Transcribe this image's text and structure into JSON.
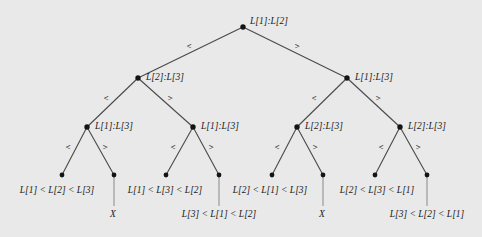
{
  "figure": {
    "type": "binary-decision-tree",
    "background_color": "#e9e9e9",
    "ink_color": "#1a1a1a",
    "width": 482,
    "height": 237
  },
  "chart_data": {
    "type": "diagram",
    "title": "",
    "nodes": [
      {
        "id": "n0",
        "label": "L[1]:L[2]",
        "kind": "internal",
        "depth": 0,
        "x": 243,
        "y": 27
      },
      {
        "id": "n1",
        "label": "L[2]:L[3]",
        "kind": "internal",
        "depth": 1,
        "x": 138,
        "y": 78
      },
      {
        "id": "n2",
        "label": "L[1]:L[3]",
        "kind": "internal",
        "depth": 1,
        "x": 347,
        "y": 78
      },
      {
        "id": "n11",
        "label": "L[1]:L[3]",
        "kind": "internal",
        "depth": 2,
        "x": 87,
        "y": 127
      },
      {
        "id": "n12",
        "label": "L[1]:L[3]",
        "kind": "internal",
        "depth": 2,
        "x": 193,
        "y": 127
      },
      {
        "id": "n21",
        "label": "L[2]:L[3]",
        "kind": "internal",
        "depth": 2,
        "x": 297,
        "y": 127
      },
      {
        "id": "n22",
        "label": "L[2]:L[3]",
        "kind": "internal",
        "depth": 2,
        "x": 400,
        "y": 127
      },
      {
        "id": "l1",
        "label": "L[1] < L[2] < L[3]",
        "kind": "leaf",
        "depth": 3,
        "x": 62,
        "y": 175
      },
      {
        "id": "l2",
        "label": "X",
        "kind": "leaf",
        "depth": 3,
        "x": 114,
        "y": 175
      },
      {
        "id": "l3",
        "label": "L[1] < L[3] < L[2]",
        "kind": "leaf",
        "depth": 3,
        "x": 166,
        "y": 175
      },
      {
        "id": "l4",
        "label": "L[3] < L[1] < L[2]",
        "kind": "leaf",
        "depth": 3,
        "x": 219,
        "y": 175
      },
      {
        "id": "l5",
        "label": "L[2] < L[1] < L[3]",
        "kind": "leaf",
        "depth": 3,
        "x": 272,
        "y": 175
      },
      {
        "id": "l6",
        "label": "X",
        "kind": "leaf",
        "depth": 3,
        "x": 323,
        "y": 175
      },
      {
        "id": "l7",
        "label": "L[2] < L[3] < L[1]",
        "kind": "leaf",
        "depth": 3,
        "x": 375,
        "y": 175
      },
      {
        "id": "l8",
        "label": "L[3] < L[2] < L[1]",
        "kind": "leaf",
        "depth": 3,
        "x": 427,
        "y": 175
      }
    ],
    "edges": [
      {
        "from": "n0",
        "to": "n1",
        "label": "<",
        "lx": 189,
        "ly": 46
      },
      {
        "from": "n0",
        "to": "n2",
        "label": ">",
        "lx": 297,
        "ly": 46
      },
      {
        "from": "n1",
        "to": "n11",
        "label": "<",
        "lx": 106,
        "ly": 98
      },
      {
        "from": "n1",
        "to": "n12",
        "label": ">",
        "lx": 170,
        "ly": 98
      },
      {
        "from": "n2",
        "to": "n21",
        "label": "<",
        "lx": 314,
        "ly": 98
      },
      {
        "from": "n2",
        "to": "n22",
        "label": ">",
        "lx": 378,
        "ly": 98
      },
      {
        "from": "n11",
        "to": "l1",
        "label": "<",
        "lx": 68,
        "ly": 146
      },
      {
        "from": "n11",
        "to": "l2",
        "label": ">",
        "lx": 104,
        "ly": 146
      },
      {
        "from": "n12",
        "to": "l3",
        "label": "<",
        "lx": 173,
        "ly": 146
      },
      {
        "from": "n12",
        "to": "l4",
        "label": ">",
        "lx": 210,
        "ly": 146
      },
      {
        "from": "n21",
        "to": "l5",
        "label": "<",
        "lx": 277,
        "ly": 146
      },
      {
        "from": "n21",
        "to": "l6",
        "label": ">",
        "lx": 314,
        "ly": 146
      },
      {
        "from": "n22",
        "to": "l7",
        "label": "<",
        "lx": 381,
        "ly": 146
      },
      {
        "from": "n22",
        "to": "l8",
        "label": ">",
        "lx": 417,
        "ly": 146
      }
    ],
    "node_labels": {
      "root": "L[1]:L[2]",
      "level1_left": "L[2]:L[3]",
      "level1_right": "L[1]:L[3]",
      "level2_a": "L[1]:L[3]",
      "level2_b": "L[1]:L[3]",
      "level2_c": "L[2]:L[3]",
      "level2_d": "L[2]:L[3]"
    },
    "leaf_labels": [
      "L[1] < L[2] < L[3]",
      "X",
      "L[1] < L[3] < L[2]",
      "L[3] < L[1] < L[2]",
      "L[2] < L[1] < L[3]",
      "X",
      "L[2] < L[3] < L[1]",
      "L[3] < L[2] < L[1]"
    ],
    "edge_labels": [
      "<",
      ">"
    ],
    "legend": [],
    "annotations": []
  }
}
